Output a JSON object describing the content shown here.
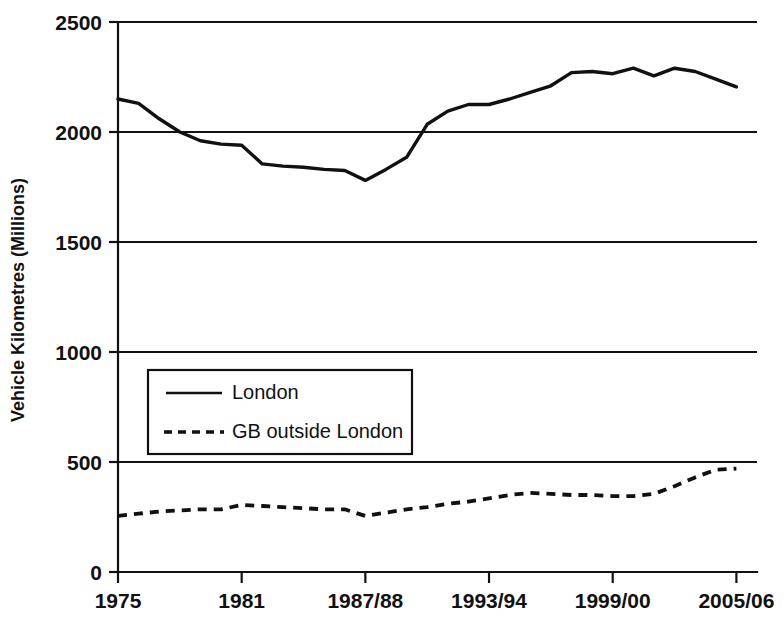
{
  "chart_data": {
    "type": "line",
    "title": "",
    "subtitle": "",
    "xlabel": "",
    "ylabel": "Vehicle Kilometres (Millions)",
    "xlim": [
      1975,
      2006
    ],
    "ylim": [
      0,
      2500
    ],
    "y_ticks": [
      0,
      500,
      1000,
      1500,
      2000,
      2500
    ],
    "y_tick_labels": [
      "0",
      "500",
      "1000",
      "1500",
      "2000",
      "2500"
    ],
    "x_ticks": [
      1975,
      1981,
      1987,
      1993,
      1999,
      2005
    ],
    "x_tick_labels": [
      "1975",
      "1981",
      "1987/88",
      "1993/94",
      "1999/00",
      "2005/06"
    ],
    "grid": "horizontal",
    "legend_position": "inside-left-middle",
    "x": [
      1975,
      1976,
      1977,
      1978,
      1979,
      1980,
      1981,
      1982,
      1983,
      1984,
      1985,
      1986,
      1987,
      1988,
      1989,
      1990,
      1991,
      1992,
      1993,
      1994,
      1995,
      1996,
      1997,
      1998,
      1999,
      2000,
      2001,
      2002,
      2003,
      2004,
      2005
    ],
    "series": [
      {
        "name": "London",
        "style": "solid",
        "color": "#111111",
        "values": [
          2150,
          2130,
          2060,
          2000,
          1960,
          1945,
          1940,
          1855,
          1845,
          1840,
          1830,
          1825,
          1780,
          1830,
          1885,
          2035,
          2095,
          2125,
          2125,
          2150,
          2180,
          2210,
          2270,
          2275,
          2265,
          2290,
          2255,
          2290,
          2275,
          2240,
          2205
        ]
      },
      {
        "name": "GB outside London",
        "style": "dashed",
        "color": "#111111",
        "values": [
          255,
          265,
          275,
          280,
          285,
          285,
          305,
          300,
          295,
          290,
          285,
          285,
          255,
          270,
          285,
          295,
          310,
          320,
          335,
          350,
          360,
          355,
          350,
          350,
          345,
          345,
          355,
          390,
          430,
          465,
          470
        ]
      }
    ],
    "legend": [
      {
        "label": "London",
        "style": "solid"
      },
      {
        "label": "GB outside London",
        "style": "dashed"
      }
    ]
  }
}
